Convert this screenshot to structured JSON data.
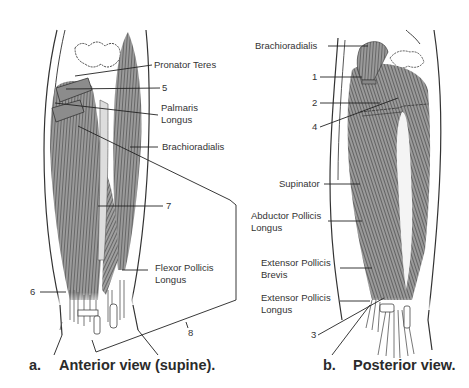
{
  "figure_a": {
    "caption_letter": "a.",
    "caption_text": "Anterior view (supine).",
    "labels": {
      "pronator_teres": "Pronator Teres",
      "five": "5",
      "palmaris_longus_1": "Palmaris",
      "palmaris_longus_2": "Longus",
      "brachioradialis": "Brachioradialis",
      "seven": "7",
      "flexor_pollicis_longus_1": "Flexor Pollicis",
      "flexor_pollicis_longus_2": "Longus",
      "six": "6",
      "eight": "8"
    }
  },
  "figure_b": {
    "caption_letter": "b.",
    "caption_text": "Posterior view.",
    "labels": {
      "brachioradialis": "Brachioradialis",
      "one": "1",
      "two": "2",
      "four": "4",
      "supinator": "Supinator",
      "abductor_pollicis_longus_1": "Abductor Pollicis",
      "abductor_pollicis_longus_2": "Longus",
      "extensor_pollicis_brevis_1": "Extensor Pollicis",
      "extensor_pollicis_brevis_2": "Brevis",
      "extensor_pollicis_longus_1": "Extensor Pollicis",
      "extensor_pollicis_longus_2": "Longus",
      "three": "3"
    }
  },
  "colors": {
    "muscle": "#8a8a8a",
    "muscle_dark": "#5e5e5e",
    "line": "#222222",
    "background": "#ffffff"
  }
}
